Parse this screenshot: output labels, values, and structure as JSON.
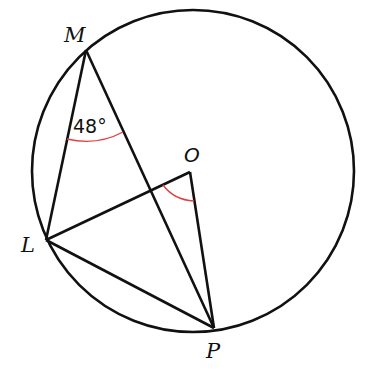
{
  "diagram": {
    "title": "",
    "circle": {
      "center": "O"
    },
    "points": {
      "M": {
        "label": "M"
      },
      "O": {
        "label": "O"
      },
      "L": {
        "label": "L"
      },
      "P": {
        "label": "P"
      }
    },
    "segments": [
      "ML",
      "MP",
      "LO",
      "OP",
      "LP"
    ],
    "angles": [
      {
        "vertex": "M",
        "between": [
          "L",
          "P"
        ],
        "label": "48°",
        "color": "#e04040"
      },
      {
        "vertex": "O",
        "between": [
          "L",
          "P"
        ],
        "label": "",
        "color": "#e04040"
      }
    ]
  }
}
